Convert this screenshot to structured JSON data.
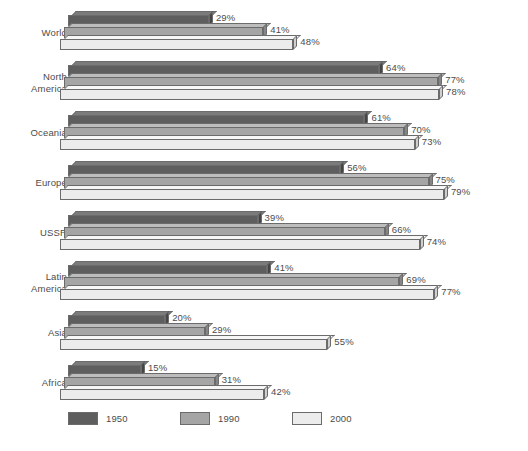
{
  "chart_data": {
    "type": "bar",
    "orientation": "horizontal",
    "title": "",
    "subtitle": "",
    "xlabel": "",
    "ylabel": "",
    "xlim": [
      0,
      100
    ],
    "grid": false,
    "legend_position": "bottom",
    "value_suffix": "%",
    "categories": [
      "World",
      "North\nAmerica",
      "Oceania",
      "Europe",
      "USSR",
      "Latin\nAmerica",
      "Asia",
      "Africa"
    ],
    "series": [
      {
        "name": "1950",
        "color": "#5e5e5e",
        "values": [
          29,
          64,
          61,
          56,
          39,
          41,
          20,
          15
        ]
      },
      {
        "name": "1990",
        "color": "#a5a5a5",
        "values": [
          41,
          77,
          70,
          75,
          66,
          69,
          29,
          31
        ]
      },
      {
        "name": "2000",
        "color": "#ececec",
        "values": [
          48,
          78,
          73,
          79,
          74,
          77,
          55,
          42
        ]
      }
    ],
    "data_labels": [
      [
        "29%",
        "41%",
        "48%"
      ],
      [
        "64%",
        "77%",
        "78%"
      ],
      [
        "61%",
        "70%",
        "73%"
      ],
      [
        "56%",
        "75%",
        "79%"
      ],
      [
        "39%",
        "66%",
        "74%"
      ],
      [
        "41%",
        "69%",
        "77%"
      ],
      [
        "20%",
        "29%",
        "55%"
      ],
      [
        "15%",
        "31%",
        "42%"
      ]
    ]
  },
  "legend": {
    "items": [
      {
        "label": "1950"
      },
      {
        "label": "1990"
      },
      {
        "label": "2000"
      }
    ]
  }
}
